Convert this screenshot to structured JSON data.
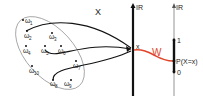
{
  "diagram": {
    "sample_space": {
      "outcomes": [
        {
          "label": "ω",
          "sub": "1",
          "x": 26,
          "y": 22
        },
        {
          "label": "ω",
          "sub": "2",
          "x": 27,
          "y": 34
        },
        {
          "label": "ω",
          "sub": "3",
          "x": 52,
          "y": 34
        },
        {
          "label": "ω",
          "sub": "4",
          "x": 26,
          "y": 50
        },
        {
          "label": "ω",
          "sub": "5",
          "x": 44,
          "y": 50
        },
        {
          "label": "ω",
          "sub": "6",
          "x": 60,
          "y": 50
        },
        {
          "label": "ω",
          "sub": "7",
          "x": 76,
          "y": 65
        },
        {
          "label": "ω",
          "sub": "10",
          "x": 32,
          "y": 70
        },
        {
          "label": "ω",
          "sub": "8",
          "x": 52,
          "y": 84
        },
        {
          "label": "ω",
          "sub": "9",
          "x": 67,
          "y": 84
        }
      ]
    },
    "mapping_label": "X",
    "real_line_1": {
      "label": "IR",
      "point_label": "x"
    },
    "real_line_2": {
      "label": "IR",
      "tick_top": "1",
      "tick_bottom": "0",
      "point_label": "P(X=x)"
    },
    "probability_map_label": "W",
    "colors": {
      "axis": "#111111",
      "thin_axis": "#888888",
      "ellipse": "#888888",
      "red_arrow": "#e0452b",
      "text": "#222222"
    }
  }
}
